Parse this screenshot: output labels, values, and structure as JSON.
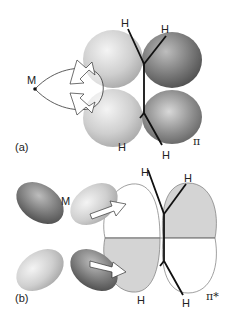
{
  "panel_a": {
    "label": "(a)",
    "metal_label": "M",
    "orbital_label": "π",
    "h_top_left": "H",
    "h_top_right": "H",
    "h_bottom_left": "H",
    "h_bottom_right": "H",
    "description": "σ donation from filled π orbital of alkene to empty metal orbital"
  },
  "panel_b": {
    "label": "(b)",
    "metal_label": "M",
    "orbital_label": "π*",
    "h_top_left": "H",
    "h_top_right": "H",
    "h_bottom_left": "H",
    "h_bottom_right": "H",
    "description": "π back-donation from filled metal d orbital to empty π* orbital of alkene"
  },
  "colors": {
    "lobe_light": "#c8c8c8",
    "lobe_dark": "#6e6e6e",
    "pistar_shade": "#d4d4d4",
    "line": "#111111"
  }
}
